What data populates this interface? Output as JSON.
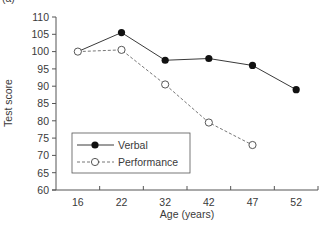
{
  "panel_label": "(a)",
  "chart_data": {
    "type": "line",
    "title": "",
    "xlabel": "Age (years)",
    "ylabel": "Test score",
    "categories": [
      "16",
      "22",
      "32",
      "42",
      "47",
      "52"
    ],
    "series": [
      {
        "name": "Verbal",
        "style": "solid",
        "marker": "filled-circle",
        "values": [
          100,
          105.5,
          97.5,
          98,
          96,
          89
        ]
      },
      {
        "name": "Performance",
        "style": "dashed",
        "marker": "open-circle",
        "values": [
          100,
          100.5,
          90.5,
          79.5,
          73,
          null
        ]
      }
    ],
    "ylim": [
      60,
      110
    ],
    "yticks": [
      60,
      65,
      70,
      75,
      80,
      85,
      90,
      95,
      100,
      105,
      110
    ],
    "grid": false,
    "legend_position": "lower-left inside",
    "colors": {
      "verbal_line": "#3a3a3a",
      "performance_line": "#777777",
      "axis": "#555555"
    }
  }
}
